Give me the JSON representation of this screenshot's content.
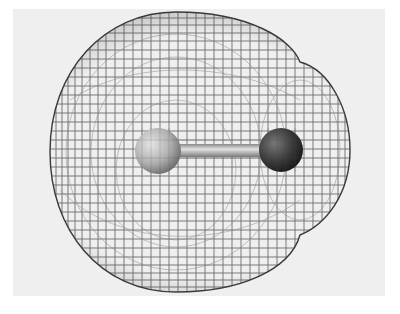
{
  "figure": {
    "kind": "molecular electron-density isosurface (wireframe mesh)",
    "background_color": "#efefef",
    "mesh_color": "#555555",
    "atoms": [
      {
        "name": "left-atom",
        "shade": "light",
        "color": "#b5b5b5"
      },
      {
        "name": "right-atom",
        "shade": "dark",
        "color": "#3c3c3c"
      }
    ],
    "bond": {
      "color": "#bdbdbd"
    }
  }
}
